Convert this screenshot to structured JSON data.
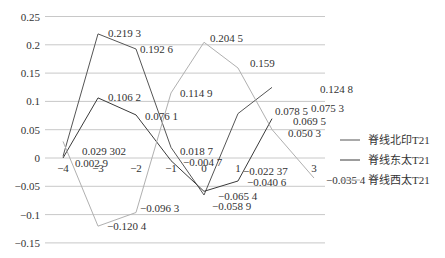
{
  "chart_data": {
    "type": "line",
    "title": "",
    "xlabel": "",
    "ylabel": "",
    "x": [
      -4,
      -3,
      -2,
      -1,
      0,
      1,
      2,
      3
    ],
    "x_tick_labels": [
      "-4",
      "-3",
      "-2",
      "-1",
      "0",
      "1",
      "3"
    ],
    "y_tick_labels": [
      "0.25",
      "0.2",
      "0.15",
      "0.1",
      "0.05",
      "0",
      "-0.05",
      "-0.1",
      "-0.15"
    ],
    "ylim": [
      -0.15,
      0.25
    ],
    "grid": true,
    "legend_position": "right",
    "series": [
      {
        "name": "脊线北印T21",
        "color": "#555555",
        "x": [
          -4,
          -3,
          -2,
          -1,
          0,
          1,
          2
        ],
        "values": [
          0.0029,
          0.2193,
          0.1926,
          0.0187,
          -0.0654,
          0.0785,
          0.1248
        ]
      },
      {
        "name": "脊线东太T21",
        "color": "#3a3a3a",
        "x": [
          -4,
          -3,
          -2,
          -1,
          0,
          1,
          2
        ],
        "values": [
          0.0,
          0.1062,
          0.0761,
          -0.0047,
          -0.0589,
          -0.0406,
          0.0695
        ]
      },
      {
        "name": "脊线西太T21",
        "color": "#b0b0b0",
        "x": [
          -4,
          -3,
          -2,
          -1,
          0,
          1,
          2,
          3
        ],
        "values": [
          0.029302,
          -0.1204,
          -0.0963,
          0.1149,
          0.2045,
          0.159,
          0.0503,
          -0.0354
        ]
      }
    ],
    "annotations": [
      {
        "text": "0.219 3",
        "x": 108,
        "y": 37
      },
      {
        "text": "0.192 6",
        "x": 140,
        "y": 53
      },
      {
        "text": "0.106 2",
        "x": 108,
        "y": 101
      },
      {
        "text": "0.076 1",
        "x": 145,
        "y": 120
      },
      {
        "text": "0.204 5",
        "x": 210,
        "y": 42
      },
      {
        "text": "0.159",
        "x": 250,
        "y": 67
      },
      {
        "text": "0.114 9",
        "x": 180,
        "y": 97
      },
      {
        "text": "0.124 8",
        "x": 320,
        "y": 93
      },
      {
        "text": "0.078 5",
        "x": 275,
        "y": 115
      },
      {
        "text": "0.075 3",
        "x": 311,
        "y": 112
      },
      {
        "text": "0.069 5",
        "x": 293,
        "y": 125
      },
      {
        "text": "0.050 3",
        "x": 288,
        "y": 137
      },
      {
        "text": "0.029 302",
        "x": 82,
        "y": 155
      },
      {
        "text": "0.002 9",
        "x": 75,
        "y": 167
      },
      {
        "text": "0.018 7",
        "x": 180,
        "y": 155
      },
      {
        "text": "−0.004 7",
        "x": 183,
        "y": 166
      },
      {
        "text": "−0.022 37",
        "x": 243,
        "y": 175
      },
      {
        "text": "−0.040 6",
        "x": 247,
        "y": 186
      },
      {
        "text": "−0.065 4",
        "x": 218,
        "y": 200
      },
      {
        "text": "−0.058 9",
        "x": 212,
        "y": 210
      },
      {
        "text": "−0.096 3",
        "x": 140,
        "y": 212
      },
      {
        "text": "−0.120 4",
        "x": 107,
        "y": 230
      },
      {
        "text": "−0.035 4",
        "x": 326,
        "y": 184
      }
    ]
  }
}
